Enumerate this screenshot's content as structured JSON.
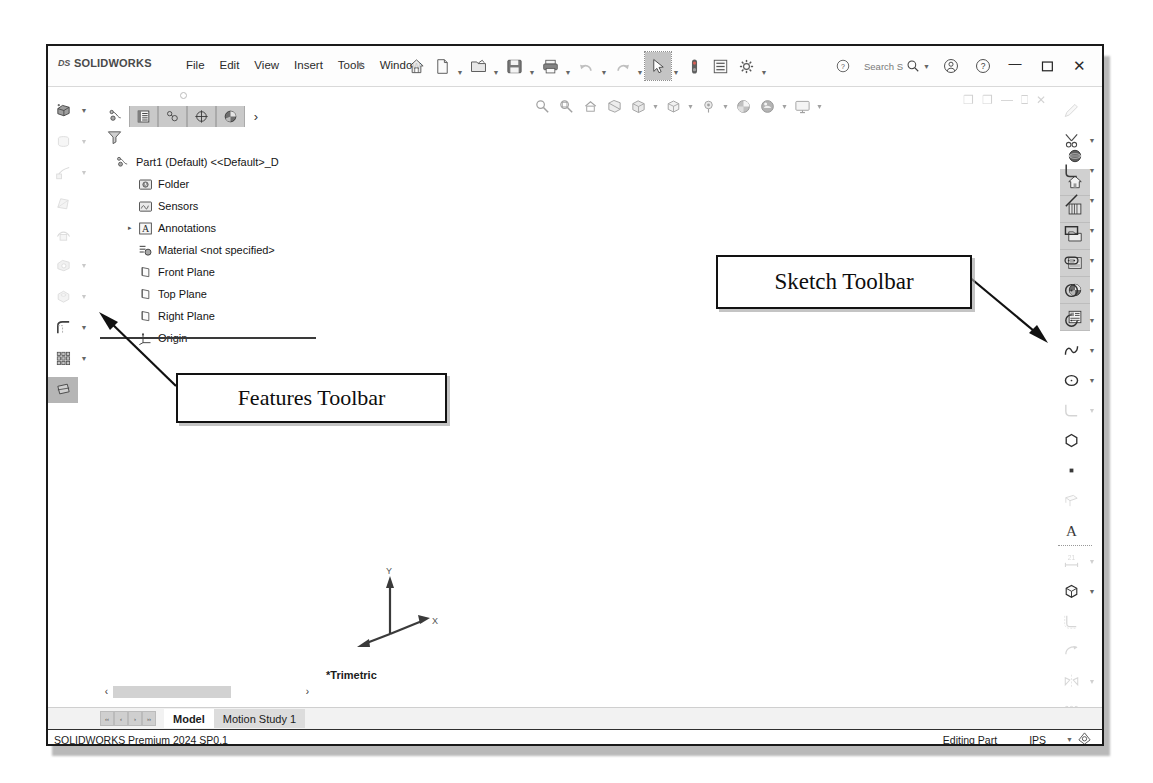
{
  "app": {
    "brand_ds": "DS",
    "brand_name": "SOLIDWORKS",
    "status_version": "SOLIDWORKS Premium 2024 SP0.1",
    "status_mode": "Editing Part",
    "status_units": "IPS"
  },
  "menu": {
    "items": [
      {
        "label": "File"
      },
      {
        "label": "Edit"
      },
      {
        "label": "View"
      },
      {
        "label": "Insert"
      },
      {
        "label": "Tools"
      },
      {
        "label": "Window"
      }
    ],
    "pin_icon": "pushpin-icon"
  },
  "quick_toolbar": {
    "buttons": [
      {
        "name": "home-button",
        "icon": "home-icon",
        "dropdown": false,
        "dim": false,
        "selected": false
      },
      {
        "name": "new-document-button",
        "icon": "new-document-icon",
        "dropdown": true,
        "dim": false,
        "selected": false
      },
      {
        "name": "open-document-button",
        "icon": "open-folder-icon",
        "dropdown": true,
        "dim": false,
        "selected": false
      },
      {
        "name": "save-button",
        "icon": "save-floppy-icon",
        "dropdown": true,
        "dim": false,
        "selected": false
      },
      {
        "name": "print-button",
        "icon": "printer-icon",
        "dropdown": true,
        "dim": false,
        "selected": false
      },
      {
        "name": "undo-button",
        "icon": "undo-arrow-icon",
        "dropdown": true,
        "dim": true,
        "selected": false
      },
      {
        "name": "redo-button",
        "icon": "redo-arrow-icon",
        "dropdown": true,
        "dim": true,
        "selected": false
      },
      {
        "name": "select-button",
        "icon": "cursor-arrow-icon",
        "dropdown": true,
        "dim": false,
        "selected": true
      },
      {
        "name": "rebuild-button",
        "icon": "rebuild-traffic-light-icon",
        "dropdown": false,
        "dim": false,
        "selected": false
      },
      {
        "name": "file-properties-button",
        "icon": "file-properties-icon",
        "dropdown": false,
        "dim": false,
        "selected": false
      },
      {
        "name": "options-button",
        "icon": "gear-icon",
        "dropdown": true,
        "dim": false,
        "selected": false
      }
    ]
  },
  "search": {
    "placeholder": "Search S",
    "value": "Search S",
    "icon": "magnifier-icon",
    "help_icon": "help-circle-icon"
  },
  "window_controls": {
    "profile_icon": "user-account-icon",
    "help_icon": "question-circle-icon",
    "minimize": "—",
    "maximize": "☐",
    "close": "✕"
  },
  "features_toolbar": {
    "name": "features-toolbar",
    "buttons": [
      {
        "name": "extruded-boss-base",
        "icon": "extruded-boss-icon",
        "dropdown": true,
        "faded": false,
        "highlight": false
      },
      {
        "name": "revolved-boss-base",
        "icon": "revolved-boss-icon",
        "dropdown": true,
        "faded": true,
        "highlight": false
      },
      {
        "name": "swept-boss-base",
        "icon": "swept-boss-icon",
        "dropdown": true,
        "faded": true,
        "highlight": false
      },
      {
        "name": "lofted-boss-base",
        "icon": "lofted-boss-icon",
        "dropdown": false,
        "faded": true,
        "highlight": false
      },
      {
        "name": "boundary-boss-base",
        "icon": "boundary-boss-icon",
        "dropdown": false,
        "faded": true,
        "highlight": false
      },
      {
        "name": "extruded-cut",
        "icon": "extruded-cut-icon",
        "dropdown": true,
        "faded": true,
        "highlight": false
      },
      {
        "name": "hole-wizard",
        "icon": "hole-wizard-icon",
        "dropdown": true,
        "faded": true,
        "highlight": false
      },
      {
        "name": "fillet",
        "icon": "fillet-icon",
        "dropdown": true,
        "faded": false,
        "highlight": false
      },
      {
        "name": "linear-pattern",
        "icon": "linear-pattern-icon",
        "dropdown": true,
        "faded": false,
        "highlight": false
      },
      {
        "name": "reference-geometry",
        "icon": "reference-geometry-icon",
        "dropdown": false,
        "faded": false,
        "highlight": true
      }
    ]
  },
  "feature_manager": {
    "tabs": [
      {
        "name": "feature-manager-tree-tab",
        "icon": "feature-tree-icon",
        "active": false
      },
      {
        "name": "property-manager-tab",
        "icon": "property-manager-icon",
        "active": true
      },
      {
        "name": "configuration-manager-tab",
        "icon": "configuration-manager-icon",
        "active": true
      },
      {
        "name": "dimxpert-manager-tab",
        "icon": "dimxpert-icon",
        "active": true
      },
      {
        "name": "display-manager-tab",
        "icon": "display-manager-icon",
        "active": true
      }
    ],
    "expand_chevron": "›",
    "filter_icon": "filter-funnel-icon",
    "tree": [
      {
        "label": "Part1 (Default) <<Default>_D",
        "icon": "part-icon",
        "level": 1,
        "expandable": false
      },
      {
        "label": "Folder",
        "icon": "history-folder-icon",
        "level": 2,
        "expandable": false
      },
      {
        "label": "Sensors",
        "icon": "sensors-icon",
        "level": 2,
        "expandable": false
      },
      {
        "label": "Annotations",
        "icon": "annotations-icon",
        "level": 2,
        "expandable": true
      },
      {
        "label": "Material <not specified>",
        "icon": "material-icon",
        "level": 2,
        "expandable": false
      },
      {
        "label": "Front Plane",
        "icon": "plane-icon",
        "level": 2,
        "expandable": false
      },
      {
        "label": "Top Plane",
        "icon": "plane-icon",
        "level": 2,
        "expandable": false
      },
      {
        "label": "Right Plane",
        "icon": "plane-icon",
        "level": 2,
        "expandable": false
      },
      {
        "label": "Origin",
        "icon": "origin-icon",
        "level": 2,
        "expandable": false
      }
    ],
    "scroll_left": "‹",
    "scroll_right": "›"
  },
  "view_toolbar": {
    "buttons": [
      {
        "name": "zoom-to-fit-button",
        "icon": "zoom-to-fit-icon",
        "dropdown": false
      },
      {
        "name": "zoom-to-area-button",
        "icon": "zoom-to-area-icon",
        "dropdown": false
      },
      {
        "name": "previous-view-button",
        "icon": "previous-view-icon",
        "dropdown": false
      },
      {
        "name": "section-view-button",
        "icon": "section-view-icon",
        "dropdown": false
      },
      {
        "name": "view-orientation-button",
        "icon": "view-orientation-icon",
        "dropdown": true
      },
      {
        "name": "display-style-button",
        "icon": "display-style-cube-icon",
        "dropdown": true
      },
      {
        "name": "hide-show-items-button",
        "icon": "hide-show-eye-icon",
        "dropdown": true
      },
      {
        "name": "apply-scene-button",
        "icon": "apply-scene-icon",
        "dropdown": false
      },
      {
        "name": "view-settings-button",
        "icon": "view-settings-icon",
        "dropdown": true
      },
      {
        "name": "viewport-button",
        "icon": "viewport-monitor-icon",
        "dropdown": true
      }
    ]
  },
  "graphics": {
    "view_label": "*Trimetric",
    "triad": {
      "x": "X",
      "y": "Y",
      "z": "Z"
    },
    "doc_window": {
      "restore": "❐",
      "minimize": "—",
      "maximize": "❐",
      "close": "✕"
    }
  },
  "task_pane": {
    "icons": [
      {
        "name": "three-d-content-central-icon"
      },
      {
        "name": "solidworks-resources-home-icon"
      },
      {
        "name": "design-library-icon"
      },
      {
        "name": "file-explorer-folder-icon"
      },
      {
        "name": "view-palette-icon"
      },
      {
        "name": "appearances-scenes-icon"
      },
      {
        "name": "custom-properties-icon"
      }
    ]
  },
  "sketch_toolbar": {
    "name": "sketch-toolbar",
    "buttons": [
      {
        "name": "sketch-button",
        "icon": "sketch-pencil-icon",
        "dropdown": false,
        "faded": true,
        "highlight": false
      },
      {
        "name": "trim-entities-button",
        "icon": "trim-entities-icon",
        "dropdown": true,
        "faded": false,
        "highlight": false
      },
      {
        "name": "line-corner-button",
        "icon": "corner-rectangle-icon",
        "dropdown": true,
        "faded": false,
        "highlight": false
      },
      {
        "name": "line-button",
        "icon": "line-icon",
        "dropdown": true,
        "faded": false,
        "highlight": false
      },
      {
        "name": "rectangle-button",
        "icon": "rectangle-icon",
        "dropdown": true,
        "faded": false,
        "highlight": false
      },
      {
        "name": "slot-button",
        "icon": "straight-slot-icon",
        "dropdown": true,
        "faded": false,
        "highlight": false
      },
      {
        "name": "circle-button",
        "icon": "circle-icon",
        "dropdown": true,
        "faded": false,
        "highlight": false
      },
      {
        "name": "arc-button",
        "icon": "centerpoint-arc-icon",
        "dropdown": true,
        "faded": false,
        "highlight": false
      },
      {
        "name": "spline-button",
        "icon": "spline-icon",
        "dropdown": true,
        "faded": false,
        "highlight": false
      },
      {
        "name": "ellipse-button",
        "icon": "ellipse-icon",
        "dropdown": true,
        "faded": false,
        "highlight": false
      },
      {
        "name": "sketch-fillet-button",
        "icon": "sketch-fillet-icon",
        "dropdown": true,
        "faded": true,
        "highlight": false
      },
      {
        "name": "polygon-button",
        "icon": "polygon-icon",
        "dropdown": false,
        "faded": false,
        "highlight": false
      },
      {
        "name": "point-button",
        "icon": "point-icon",
        "dropdown": false,
        "faded": false,
        "highlight": false
      },
      {
        "name": "plane-sketch-button",
        "icon": "sketch-plane-icon",
        "dropdown": false,
        "faded": true,
        "highlight": false
      },
      {
        "name": "text-button",
        "icon": "text-a-icon",
        "dropdown": false,
        "faded": false,
        "highlight": false
      },
      {
        "name": "smart-dimension-button",
        "icon": "smart-dimension-icon",
        "dropdown": true,
        "faded": true,
        "highlight": false
      },
      {
        "name": "three-d-sketch-button",
        "icon": "three-d-sketch-cube-icon",
        "dropdown": true,
        "faded": false,
        "highlight": false
      },
      {
        "name": "offset-entities-button",
        "icon": "offset-entities-icon",
        "dropdown": false,
        "faded": true,
        "highlight": false
      },
      {
        "name": "convert-entities-button",
        "icon": "convert-entities-icon",
        "dropdown": false,
        "faded": true,
        "highlight": false
      },
      {
        "name": "mirror-entities-button",
        "icon": "mirror-entities-icon",
        "dropdown": true,
        "faded": true,
        "highlight": false
      },
      {
        "name": "linear-sketch-pattern-button",
        "icon": "linear-sketch-pattern-icon",
        "dropdown": true,
        "faded": true,
        "highlight": false
      },
      {
        "name": "move-entities-button",
        "icon": "move-entities-icon",
        "dropdown": true,
        "faded": true,
        "highlight": false
      },
      {
        "name": "display-delete-relations-button",
        "icon": "display-delete-relations-icon",
        "dropdown": true,
        "faded": true,
        "highlight": false
      },
      {
        "name": "repair-sketch-button",
        "icon": "repair-sketch-icon",
        "dropdown": true,
        "faded": true,
        "highlight": false
      },
      {
        "name": "quick-snaps-button",
        "icon": "quick-snaps-icon",
        "dropdown": false,
        "faded": false,
        "highlight": false
      },
      {
        "name": "rapid-sketch-button",
        "icon": "rapid-sketch-icon",
        "dropdown": false,
        "faded": false,
        "highlight": true
      }
    ]
  },
  "document_tabs": {
    "nav_arrows": [
      "‹‹",
      "‹",
      "›",
      "››"
    ],
    "tabs": [
      {
        "label": "Model",
        "active": true
      },
      {
        "label": "Motion Study 1",
        "active": false
      }
    ]
  },
  "callouts": [
    {
      "name": "callout-features-toolbar",
      "label": "Features Toolbar"
    },
    {
      "name": "callout-sketch-toolbar",
      "label": "Sketch Toolbar"
    }
  ]
}
